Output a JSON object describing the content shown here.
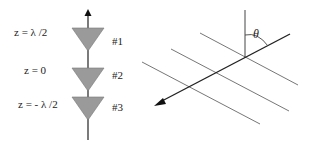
{
  "array": {
    "elements": [
      {
        "z_label": "z = λ /2",
        "id_label": "#1"
      },
      {
        "z_label": "z = 0",
        "id_label": "#2"
      },
      {
        "z_label": "z = - λ /2",
        "id_label": "#3"
      }
    ]
  },
  "geometry": {
    "angle_label": "θ"
  },
  "colors": {
    "triangle_fill": "#9a9a9a",
    "line": "#333333",
    "plane_lines": "#555555"
  }
}
